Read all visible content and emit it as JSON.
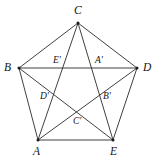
{
  "figure": {
    "type": "geometry-diagram",
    "canvas": {
      "width": 159,
      "height": 167,
      "background": "#ffffff"
    },
    "style": {
      "line_color": "#2b2b2b",
      "line_width": 0.9,
      "vertex_dot_color": "#1a1a1a",
      "label_color": "#141414"
    },
    "outer_vertices": [
      {
        "id": "A",
        "label": "A",
        "x": 38,
        "y": 140,
        "label_x": 33,
        "label_y": 146
      },
      {
        "id": "B",
        "label": "B",
        "x": 19,
        "y": 68,
        "label_x": 4,
        "label_y": 62
      },
      {
        "id": "C",
        "label": "C",
        "x": 78,
        "y": 23,
        "label_x": 74,
        "label_y": 5
      },
      {
        "id": "D",
        "label": "D",
        "x": 137,
        "y": 68,
        "label_x": 143,
        "label_y": 62
      },
      {
        "id": "E",
        "label": "E",
        "x": 113,
        "y": 140,
        "label_x": 110,
        "label_y": 146
      }
    ],
    "inner_vertices": [
      {
        "id": "Aprime",
        "label": "A'",
        "x": 99,
        "y": 68,
        "label_x": 95,
        "label_y": 56
      },
      {
        "id": "Bprime",
        "label": "B'",
        "x": 101,
        "y": 101,
        "label_x": 103,
        "label_y": 92
      },
      {
        "id": "Cprime",
        "label": "C'",
        "x": 77,
        "y": 116,
        "label_x": 73,
        "label_y": 117
      },
      {
        "id": "Dprime",
        "label": "D'",
        "x": 53,
        "y": 101,
        "label_x": 40,
        "label_y": 92
      },
      {
        "id": "Eprime",
        "label": "E'",
        "x": 56,
        "y": 68,
        "label_x": 53,
        "label_y": 56
      }
    ],
    "edges": [
      {
        "name": "edge-A-B",
        "from": "A",
        "to": "B"
      },
      {
        "name": "edge-B-C",
        "from": "B",
        "to": "C"
      },
      {
        "name": "edge-C-D",
        "from": "C",
        "to": "D"
      },
      {
        "name": "edge-D-E",
        "from": "D",
        "to": "E"
      },
      {
        "name": "edge-E-A",
        "from": "E",
        "to": "A"
      }
    ],
    "diagonals": [
      {
        "name": "diagonal-A-C",
        "from": "A",
        "to": "C"
      },
      {
        "name": "diagonal-A-D",
        "from": "A",
        "to": "D"
      },
      {
        "name": "diagonal-B-D",
        "from": "B",
        "to": "D"
      },
      {
        "name": "diagonal-B-E",
        "from": "B",
        "to": "E"
      },
      {
        "name": "diagonal-C-E",
        "from": "C",
        "to": "E"
      }
    ]
  }
}
